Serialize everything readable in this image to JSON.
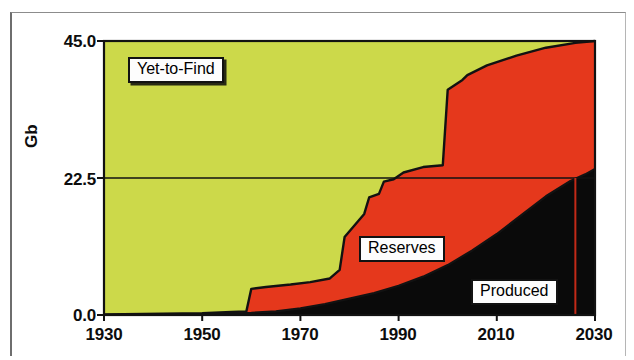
{
  "chart_data": {
    "type": "area",
    "title": "",
    "subtitle": "",
    "xlabel": "",
    "ylabel": "Gb",
    "xlim": [
      1930,
      2030
    ],
    "ylim": [
      0.0,
      45.0
    ],
    "yticks": [
      "0.0",
      "22.5",
      "45.0"
    ],
    "ytick_values": [
      0.0,
      22.5,
      45.0
    ],
    "xticks": [
      "1930",
      "1950",
      "1970",
      "1990",
      "2010",
      "2030"
    ],
    "xtick_values": [
      1930,
      1950,
      1970,
      1990,
      2010,
      2030
    ],
    "grid": false,
    "legend_position": "inline-annotations",
    "stacking": "stacked-to-constant-total",
    "total_ultimate": 45.0,
    "annotations": [
      {
        "name": "yet-to-find-label",
        "text": "Yet-to-Find",
        "x": 1943,
        "y": 38.5
      },
      {
        "name": "reserves-label",
        "text": "Reserves",
        "x": 1991,
        "y": 13.6
      },
      {
        "name": "produced-label",
        "text": "Produced",
        "x": 2014,
        "y": 3.6
      }
    ],
    "reference_lines": [
      {
        "name": "half-ultimate-line",
        "orientation": "horizontal",
        "value": 22.5,
        "color": "#121212"
      },
      {
        "name": "peak-marker-line",
        "orientation": "vertical",
        "value": 2026,
        "color": "#c22a18",
        "y_from": 0.0,
        "y_to": 22.5
      }
    ],
    "series": [
      {
        "name": "Produced",
        "color": "#0a0a0a",
        "values": [
          {
            "x": 1930,
            "y": 0.02
          },
          {
            "x": 1940,
            "y": 0.05
          },
          {
            "x": 1950,
            "y": 0.1
          },
          {
            "x": 1955,
            "y": 0.2
          },
          {
            "x": 1960,
            "y": 0.35
          },
          {
            "x": 1965,
            "y": 0.6
          },
          {
            "x": 1970,
            "y": 1.1
          },
          {
            "x": 1975,
            "y": 1.8
          },
          {
            "x": 1980,
            "y": 2.7
          },
          {
            "x": 1985,
            "y": 3.6
          },
          {
            "x": 1990,
            "y": 4.8
          },
          {
            "x": 1995,
            "y": 6.3
          },
          {
            "x": 2000,
            "y": 8.2
          },
          {
            "x": 2005,
            "y": 10.6
          },
          {
            "x": 2010,
            "y": 13.3
          },
          {
            "x": 2015,
            "y": 16.4
          },
          {
            "x": 2020,
            "y": 19.5
          },
          {
            "x": 2025,
            "y": 22.0
          },
          {
            "x": 2028,
            "y": 23.1
          },
          {
            "x": 2030,
            "y": 24.0
          }
        ]
      },
      {
        "name": "Reserves",
        "color": "#e5381c",
        "description": "Cumulative discovery minus cumulative production",
        "cumulative_discovery": [
          {
            "x": 1930,
            "y": 0.1
          },
          {
            "x": 1950,
            "y": 0.3
          },
          {
            "x": 1956,
            "y": 0.5
          },
          {
            "x": 1959,
            "y": 0.6
          },
          {
            "x": 1960,
            "y": 4.3
          },
          {
            "x": 1963,
            "y": 4.6
          },
          {
            "x": 1968,
            "y": 5.0
          },
          {
            "x": 1972,
            "y": 5.4
          },
          {
            "x": 1976,
            "y": 6.0
          },
          {
            "x": 1978,
            "y": 7.4
          },
          {
            "x": 1979,
            "y": 12.8
          },
          {
            "x": 1983,
            "y": 16.6
          },
          {
            "x": 1984,
            "y": 19.3
          },
          {
            "x": 1986,
            "y": 19.9
          },
          {
            "x": 1987,
            "y": 21.9
          },
          {
            "x": 1989,
            "y": 22.3
          },
          {
            "x": 1991,
            "y": 23.4
          },
          {
            "x": 1995,
            "y": 24.3
          },
          {
            "x": 1999,
            "y": 24.6
          },
          {
            "x": 2000,
            "y": 37.0
          },
          {
            "x": 2003,
            "y": 38.6
          },
          {
            "x": 2004,
            "y": 39.4
          },
          {
            "x": 2008,
            "y": 41.0
          },
          {
            "x": 2014,
            "y": 42.6
          },
          {
            "x": 2020,
            "y": 43.9
          },
          {
            "x": 2026,
            "y": 44.7
          },
          {
            "x": 2030,
            "y": 45.0
          }
        ]
      },
      {
        "name": "Yet-to-Find",
        "color": "#ccd94a",
        "description": "Ultimate recoverable (45.0 Gb) minus cumulative discovery"
      }
    ]
  },
  "axes": {
    "y_title": "Gb",
    "y_ticks": [
      "45.0",
      "22.5",
      "0.0"
    ],
    "x_ticks": [
      "1930",
      "1950",
      "1970",
      "1990",
      "2010",
      "2030"
    ]
  },
  "labels": {
    "yet_to_find": "Yet-to-Find",
    "reserves": "Reserves",
    "produced": "Produced"
  },
  "colors": {
    "yet_to_find": "#ccd94a",
    "reserves": "#e5381c",
    "produced": "#0a0a0a",
    "outline": "#121212",
    "peak_line": "#c22a18",
    "background": "#ffffff",
    "frame": "#8c8c8c"
  }
}
